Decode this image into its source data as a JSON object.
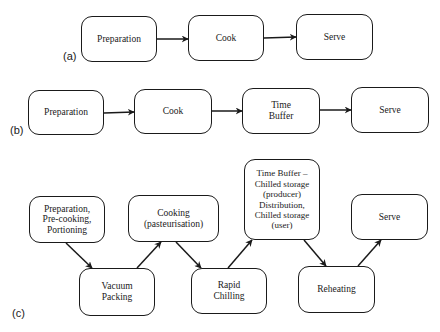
{
  "diagram": {
    "panels": [
      {
        "label": "(a)",
        "nodes": [
          "Preparation",
          "Cook",
          "Serve"
        ],
        "edges": [
          [
            "Preparation",
            "Cook"
          ],
          [
            "Cook",
            "Serve"
          ]
        ]
      },
      {
        "label": "(b)",
        "nodes": [
          "Preparation",
          "Cook",
          "Time\nBuffer",
          "Serve"
        ],
        "edges": [
          [
            "Preparation",
            "Cook"
          ],
          [
            "Cook",
            "Time Buffer"
          ],
          [
            "Time Buffer",
            "Serve"
          ]
        ]
      },
      {
        "label": "(c)",
        "nodes": [
          "Preparation,\nPre-cooking,\nPortioning",
          "Vacuum\nPacking",
          "Cooking\n(pasteurisation)",
          "Rapid\nChilling",
          "Time Buffer –\nChilled storage\n(producer)\nDistribution,\nChilled storage\n(user)",
          "Reheating",
          "Serve"
        ],
        "edges": [
          [
            "Preparation, Pre-cooking, Portioning",
            "Vacuum Packing"
          ],
          [
            "Vacuum Packing",
            "Cooking (pasteurisation)"
          ],
          [
            "Cooking (pasteurisation)",
            "Rapid Chilling"
          ],
          [
            "Rapid Chilling",
            "Time Buffer – Chilled storage (producer) Distribution, Chilled storage (user)"
          ],
          [
            "Time Buffer – Chilled storage (producer) Distribution, Chilled storage (user)",
            "Reheating"
          ],
          [
            "Reheating",
            "Serve"
          ]
        ]
      }
    ]
  },
  "colors": {
    "stroke": "#1a1a1a",
    "background": "#ffffff"
  }
}
